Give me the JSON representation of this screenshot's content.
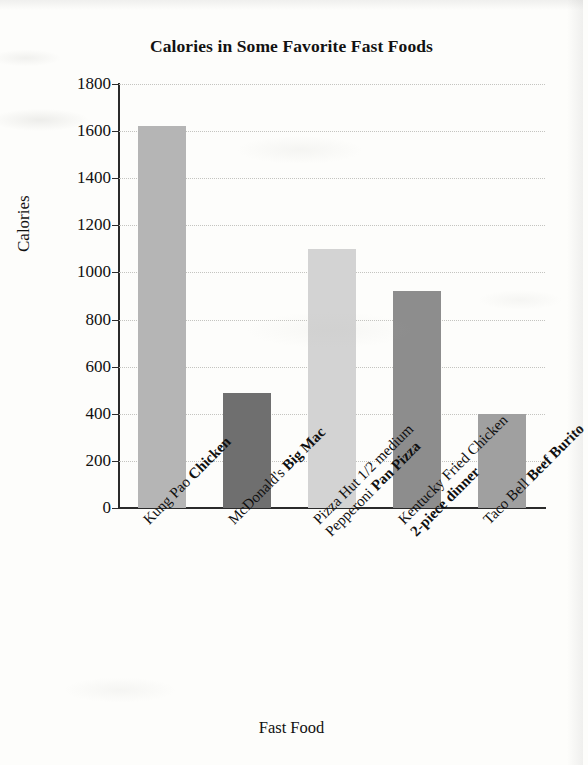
{
  "chart_data": {
    "type": "bar",
    "title": "Calories in Some Favorite Fast Foods",
    "xlabel": "Fast Food",
    "ylabel": "Calories",
    "ylim": [
      0,
      1800
    ],
    "ytick_step": 200,
    "ytick_labels": [
      "0",
      "200",
      "400",
      "600",
      "800",
      "1000",
      "1200",
      "1400",
      "1600",
      "1800"
    ],
    "grid": true,
    "legend": null,
    "categories": [
      "Kung Pao Chicken",
      "McDonald's Big Mac",
      "Pizza Hut 1/2 medium Pepperoni Pan Pizza",
      "Kentucky Fried Chicken 2-piece dinner",
      "Taco Bell Beef Burito"
    ],
    "values": [
      1620,
      490,
      1100,
      920,
      400
    ],
    "bar_colors": [
      "#b5b5b5",
      "#6f6f6f",
      "#d3d3d3",
      "#8d8d8d",
      "#a0a0a0"
    ]
  },
  "x_labels": [
    {
      "plain": "Kung Pao ",
      "bold": "Chicken",
      "line2_plain": "",
      "line2_bold": ""
    },
    {
      "plain": "McDonald's ",
      "bold": "Big Mac",
      "line2_plain": "",
      "line2_bold": ""
    },
    {
      "plain": "Pizza Hut 1/2 medium",
      "bold": "",
      "line2_plain": "Pepperoni ",
      "line2_bold": "Pan Pizza"
    },
    {
      "plain": "Kentucky Fried Chicken",
      "bold": "",
      "line2_plain": "",
      "line2_bold": "2-piece dinner"
    },
    {
      "plain": "Taco Bell ",
      "bold": "Beef Burito",
      "line2_plain": "",
      "line2_bold": ""
    }
  ]
}
